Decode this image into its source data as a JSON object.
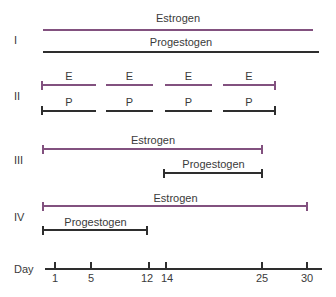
{
  "figure": {
    "groups": [
      {
        "numeral": "I",
        "bars": [
          {
            "hormone": "estrogen",
            "label": "Estrogen"
          },
          {
            "hormone": "progestogen",
            "label": "Progestogen"
          }
        ]
      },
      {
        "numeral": "II",
        "estrogen_segments": [
          "E",
          "E",
          "E",
          "E"
        ],
        "progestogen_segments": [
          "P",
          "P",
          "P",
          "P"
        ]
      },
      {
        "numeral": "III",
        "bars": [
          {
            "hormone": "estrogen",
            "label": "Estrogen"
          },
          {
            "hormone": "progestogen",
            "label": "Progestogen"
          }
        ]
      },
      {
        "numeral": "IV",
        "bars": [
          {
            "hormone": "estrogen",
            "label": "Estrogen"
          },
          {
            "hormone": "progestogen",
            "label": "Progestogen"
          }
        ]
      }
    ],
    "axis": {
      "label": "Day",
      "ticks": [
        "1",
        "5",
        "12",
        "14",
        "25",
        "30"
      ]
    },
    "colors": {
      "estrogen": "#82517f",
      "progestogen": "#2e2e2e",
      "text": "#3a3a3a",
      "background": "#ffffff"
    }
  }
}
